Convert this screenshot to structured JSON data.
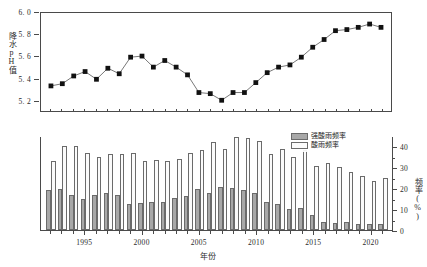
{
  "chart_data": [
    {
      "id": "precipitation-ph",
      "type": "line",
      "title": "",
      "xlabel": "",
      "ylabel": "降水pH值",
      "ylim": [
        5.1,
        6.0
      ],
      "yticks": [
        5.2,
        5.4,
        5.6,
        5.8,
        6.0
      ],
      "ytick_labels": [
        "5. 2",
        "5. 4",
        "5. 6",
        "5. 8",
        "6. 0"
      ],
      "grid": false,
      "marker": "filled-square",
      "marker_color": "#111111",
      "line_color": "#555555",
      "x": [
        1992,
        1993,
        1994,
        1995,
        1996,
        1997,
        1998,
        1999,
        2000,
        2001,
        2002,
        2003,
        2004,
        2005,
        2006,
        2007,
        2008,
        2009,
        2010,
        2011,
        2012,
        2013,
        2014,
        2015,
        2016,
        2017,
        2018,
        2019,
        2020,
        2021
      ],
      "values": [
        5.34,
        5.36,
        5.43,
        5.47,
        5.4,
        5.5,
        5.45,
        5.6,
        5.61,
        5.51,
        5.57,
        5.51,
        5.44,
        5.28,
        5.27,
        5.21,
        5.28,
        5.28,
        5.37,
        5.46,
        5.51,
        5.53,
        5.6,
        5.69,
        5.76,
        5.84,
        5.85,
        5.87,
        5.9,
        5.87
      ]
    },
    {
      "id": "acid-rain-frequency",
      "type": "bar",
      "title": "",
      "xlabel": "年份",
      "ylabel": "频率(%)",
      "ylim": [
        0,
        45
      ],
      "yticks": [
        0,
        10,
        20,
        30,
        40
      ],
      "ytick_labels": [
        "0",
        "10",
        "20",
        "30",
        "40"
      ],
      "xticks": [
        1995,
        2000,
        2005,
        2010,
        2015,
        2020
      ],
      "xtick_labels": [
        "1995",
        "2000",
        "2005",
        "2010",
        "2015",
        "2020"
      ],
      "grid": false,
      "categories": [
        1992,
        1993,
        1994,
        1995,
        1996,
        1997,
        1998,
        1999,
        2000,
        2001,
        2002,
        2003,
        2004,
        2005,
        2006,
        2007,
        2008,
        2009,
        2010,
        2011,
        2012,
        2013,
        2014,
        2015,
        2016,
        2017,
        2018,
        2019,
        2020,
        2021
      ],
      "series": [
        {
          "name": "强酸雨频率",
          "color": "#a8a8a8",
          "values": [
            19.0,
            19.5,
            17.0,
            15.0,
            17.0,
            17.5,
            17.0,
            12.5,
            13.0,
            13.5,
            13.5,
            15.5,
            16.5,
            19.5,
            17.5,
            20.5,
            20.0,
            19.0,
            17.5,
            13.5,
            12.5,
            10.0,
            10.5,
            7.0,
            4.0,
            3.5,
            4.0,
            3.0,
            3.0,
            3.0,
            1.5
          ]
        },
        {
          "name": "酸雨频率",
          "color": "#fbfbfb",
          "values": [
            33.0,
            40.0,
            40.0,
            37.0,
            35.0,
            36.5,
            36.5,
            37.0,
            33.0,
            33.5,
            33.0,
            34.0,
            37.0,
            38.5,
            42.0,
            39.0,
            44.5,
            44.0,
            42.5,
            36.5,
            39.0,
            35.0,
            38.5,
            30.5,
            32.0,
            30.0,
            28.0,
            26.0,
            23.5,
            25.0,
            24.0,
            21.0
          ]
        }
      ],
      "legend": {
        "position": "top-right",
        "entries": [
          "强酸雨频率",
          "酸雨频率"
        ]
      }
    }
  ],
  "top_chart": {
    "ylabel": "降水pH值",
    "ytick_labels": [
      "6. 0",
      "5. 8",
      "5. 6",
      "5. 4",
      "5. 2"
    ]
  },
  "bottom_chart": {
    "ylabel": "频率(%)",
    "xlabel": "年份",
    "ytick_labels": [
      "40",
      "30",
      "20",
      "10",
      "0"
    ],
    "xtick_labels": [
      "1995",
      "2000",
      "2005",
      "2010",
      "2015",
      "2020"
    ]
  },
  "legend": {
    "strong_acid_label": "强酸雨频率",
    "acid_label": "酸雨频率"
  }
}
